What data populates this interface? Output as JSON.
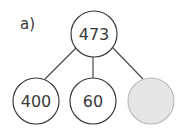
{
  "label": "a)",
  "root": {
    "value": "473"
  },
  "children": [
    {
      "value": "400",
      "filled": false
    },
    {
      "value": "60",
      "filled": false
    },
    {
      "value": "",
      "filled": true,
      "fill_color": "#e6e6e6"
    }
  ],
  "colors": {
    "stroke": "#3a3a3a",
    "empty_fill": "#e6e6e6",
    "empty_stroke": "#bdbdbd"
  }
}
